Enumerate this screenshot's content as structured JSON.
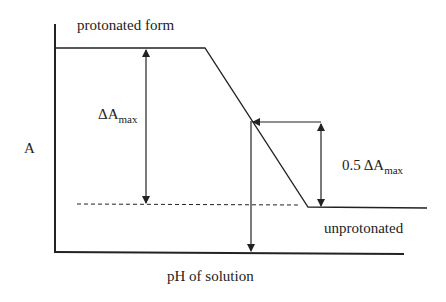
{
  "diagram": {
    "type": "absorbance-vs-pH titration curve",
    "y_axis_label": "A",
    "x_axis_label": "pH of solution",
    "upper_plateau_label": "protonated form",
    "lower_plateau_label": "unprotonated",
    "delta_label": {
      "prefix": "ΔA",
      "subscript": "max"
    },
    "half_delta_label": {
      "prefix": "0.5 ΔA",
      "subscript": "max"
    },
    "colors": {
      "line": "#222222",
      "background": "#ffffff"
    }
  }
}
